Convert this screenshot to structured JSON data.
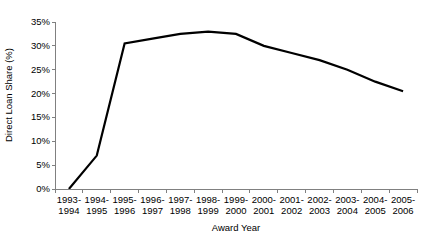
{
  "chart_data": {
    "type": "line",
    "title": "",
    "xlabel": "Award Year",
    "ylabel": "Direct Loan Share (%)",
    "categories": [
      "1993-1994",
      "1994-1995",
      "1995-1996",
      "1996-1997",
      "1997-1998",
      "1998-1999",
      "1999-2000",
      "2000-2001",
      "2001-2002",
      "2002-2003",
      "2003-2004",
      "2004-2005",
      "2005-2006"
    ],
    "categories_line1": [
      "1993-",
      "1994-",
      "1995-",
      "1996-",
      "1997-",
      "1998-",
      "1999-",
      "2000-",
      "2001-",
      "2002-",
      "2003-",
      "2004-",
      "2005-"
    ],
    "categories_line2": [
      "1994",
      "1995",
      "1996",
      "1997",
      "1998",
      "1999",
      "2000",
      "2001",
      "2002",
      "2003",
      "2004",
      "2005",
      "2006"
    ],
    "values": [
      0,
      7,
      30.5,
      31.5,
      32.5,
      33,
      32.5,
      30,
      28.5,
      27,
      25,
      22.5,
      20.5
    ],
    "ylim": [
      0,
      35
    ],
    "ytick_values": [
      0,
      5,
      10,
      15,
      20,
      25,
      30,
      35
    ],
    "ytick_labels": [
      "0%",
      "5%",
      "10%",
      "15%",
      "20%",
      "25%",
      "30%",
      "35%"
    ],
    "grid": false,
    "legend": false,
    "legend_position": "none",
    "series_color": "#000000",
    "line_width": 2.2,
    "axis_color": "#808080"
  }
}
